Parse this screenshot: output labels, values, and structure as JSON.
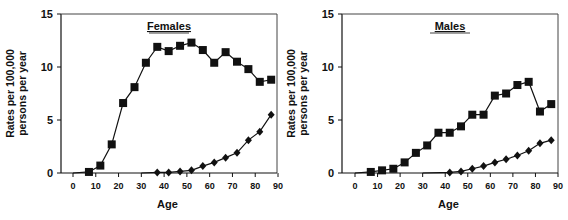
{
  "chart_data": [
    {
      "type": "line",
      "title": "Females",
      "xlabel": "Age",
      "ylabel": "Rates per 100,000 persons per year",
      "ylabel_lines": [
        "Rates per 100,000",
        "persons per year"
      ],
      "xlim": [
        -5,
        90
      ],
      "ylim": [
        0,
        15
      ],
      "xticks": [
        0,
        10,
        20,
        30,
        40,
        50,
        60,
        70,
        80,
        90
      ],
      "yticks": [
        0,
        5,
        10,
        15
      ],
      "grid": false,
      "series": [
        {
          "name": "squares",
          "marker": "square",
          "x": [
            7,
            12,
            17,
            22,
            27,
            32,
            37,
            42,
            47,
            52,
            57,
            62,
            67,
            72,
            77,
            82,
            87
          ],
          "values": [
            0.1,
            0.7,
            2.7,
            6.6,
            8.1,
            10.4,
            11.9,
            11.5,
            12.0,
            12.3,
            11.6,
            10.4,
            11.4,
            10.5,
            9.8,
            8.6,
            8.8
          ]
        },
        {
          "name": "diamonds",
          "marker": "diamond",
          "x": [
            37,
            42,
            47,
            52,
            57,
            62,
            67,
            72,
            77,
            82,
            87
          ],
          "values": [
            0.05,
            0.05,
            0.15,
            0.25,
            0.65,
            1.0,
            1.45,
            1.9,
            3.1,
            3.9,
            5.5
          ]
        }
      ]
    },
    {
      "type": "line",
      "title": "Males",
      "xlabel": "Age",
      "ylabel": "Rates per 100,000 persons per year",
      "ylabel_lines": [
        "Rates per 100,000",
        "persons per year"
      ],
      "xlim": [
        -5,
        90
      ],
      "ylim": [
        0,
        15
      ],
      "xticks": [
        0,
        10,
        20,
        30,
        40,
        50,
        60,
        70,
        80,
        90
      ],
      "yticks": [
        0,
        5,
        10,
        15
      ],
      "grid": false,
      "series": [
        {
          "name": "squares",
          "marker": "square",
          "x": [
            7,
            12,
            17,
            22,
            27,
            32,
            37,
            42,
            47,
            52,
            57,
            62,
            67,
            72,
            77,
            82,
            87
          ],
          "values": [
            0.1,
            0.25,
            0.4,
            1.0,
            1.9,
            2.6,
            3.8,
            3.8,
            4.4,
            5.5,
            5.5,
            7.3,
            7.5,
            8.3,
            8.6,
            5.8,
            6.5
          ]
        },
        {
          "name": "diamonds",
          "marker": "diamond",
          "x": [
            42,
            47,
            52,
            57,
            62,
            67,
            72,
            77,
            82,
            87
          ],
          "values": [
            0.05,
            0.15,
            0.4,
            0.65,
            1.0,
            1.3,
            1.65,
            2.1,
            2.8,
            3.1
          ]
        }
      ]
    }
  ],
  "layout": {
    "panels": [
      {
        "left": 61,
        "right": 277,
        "top": 14,
        "bottom": 173,
        "x0px": 73,
        "x90px": 278
      },
      {
        "left": 342,
        "right": 558,
        "top": 14,
        "bottom": 173,
        "x0px": 355,
        "x90px": 558
      }
    ],
    "line_color": "#111111"
  }
}
